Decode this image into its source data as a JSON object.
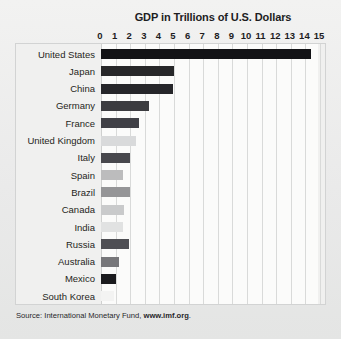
{
  "chart_data": {
    "type": "bar",
    "orientation": "horizontal",
    "title": "GDP in Trillions of U.S. Dollars",
    "xlabel": "",
    "ylabel": "",
    "xlim": [
      0,
      15
    ],
    "xticks": [
      0,
      1,
      2,
      3,
      4,
      5,
      6,
      7,
      8,
      9,
      10,
      11,
      12,
      13,
      14,
      15
    ],
    "grid": true,
    "legend": "none",
    "categories": [
      "United States",
      "Japan",
      "China",
      "Germany",
      "France",
      "United Kingdom",
      "Italy",
      "Spain",
      "Brazil",
      "Canada",
      "India",
      "Russia",
      "Australia",
      "Mexico",
      "South Korea"
    ],
    "values": [
      14.4,
      5.0,
      4.9,
      3.3,
      2.6,
      2.4,
      2.0,
      1.5,
      2.0,
      1.6,
      1.5,
      1.9,
      1.2,
      1.0,
      0.9
    ],
    "bar_colors": [
      "#131316",
      "#272729",
      "#26262a",
      "#3c3c40",
      "#404046",
      "#d9dadb",
      "#48484d",
      "#bcbcbd",
      "#959597",
      "#c9cacb",
      "#e1e2e2",
      "#4f4f54",
      "#77777a",
      "#1b1b1e",
      "#f3f3f2"
    ],
    "source": {
      "prefix": "Source: International Monetary Fund, ",
      "link": "www.imf.org",
      "suffix": "."
    }
  },
  "colors": {
    "page_background": "#eceded",
    "plot_background": "#fbfbfa",
    "gridline": "#d9dad9",
    "frame_border": "#d2d3d3",
    "text": "#1d1d1f"
  }
}
